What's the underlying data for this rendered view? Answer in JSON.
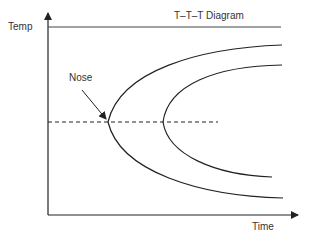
{
  "diagram": {
    "title": "T–T–T Diagram",
    "y_axis_label": "Temp",
    "x_axis_label": "Time",
    "annotation": "Nose",
    "elements": {
      "curves": [
        "outer C-curve (start of transformation)",
        "inner C-curve (end of transformation)"
      ],
      "reference_lines": [
        "horizontal top line",
        "dashed horizontal line through nose"
      ]
    },
    "colors": {
      "line": "#222222",
      "text": "#333333",
      "background": "#ffffff"
    }
  }
}
